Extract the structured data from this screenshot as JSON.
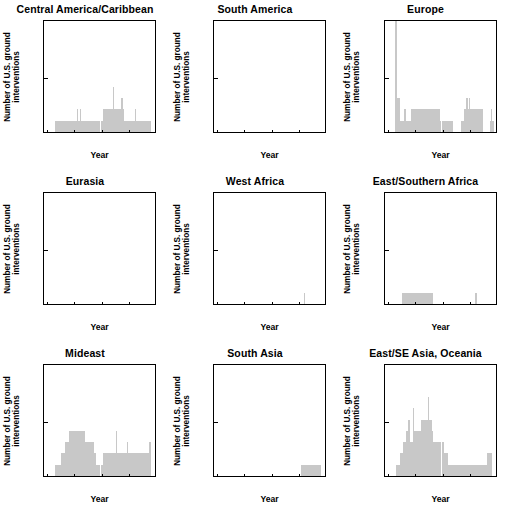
{
  "figure": {
    "axis_label_x": "Year",
    "axis_label_y_line1": "Number of U.S. ground",
    "axis_label_y_line2": "interventions",
    "bar_color": "#c8c8c8",
    "axis_color": "#000000",
    "background": "#ffffff",
    "xticks": [
      "1940",
      "1960",
      "1980",
      "2000",
      "2020"
    ],
    "yticks": [
      "0",
      "5",
      "10"
    ]
  },
  "chart_data": {
    "type": "bar",
    "title": "",
    "xlabel": "Year",
    "ylabel": "Number of U.S. ground interventions",
    "xlim": [
      1938,
      2020
    ],
    "ylim": [
      0,
      10
    ],
    "xtick_values": [
      1940,
      1960,
      1980,
      2000,
      2020
    ],
    "ytick_values": [
      0,
      5,
      10
    ],
    "grid": false,
    "legend": null,
    "bin_width_years": 1,
    "panels": [
      {
        "name": "Central America/Caribbean",
        "row": 1,
        "col": 1,
        "x": [
          1946,
          1947,
          1948,
          1949,
          1950,
          1951,
          1952,
          1953,
          1954,
          1955,
          1956,
          1957,
          1958,
          1959,
          1960,
          1961,
          1962,
          1963,
          1964,
          1965,
          1966,
          1967,
          1968,
          1969,
          1970,
          1971,
          1972,
          1973,
          1974,
          1975,
          1976,
          1977,
          1978,
          1979,
          1980,
          1981,
          1982,
          1983,
          1984,
          1985,
          1986,
          1987,
          1988,
          1989,
          1990,
          1991,
          1992,
          1993,
          1994,
          1995,
          1996,
          1997,
          1998,
          1999,
          2000,
          2001,
          2002,
          2003,
          2004,
          2005,
          2006,
          2007,
          2008,
          2009,
          2010,
          2011,
          2012,
          2013,
          2014,
          2015
        ],
        "y": [
          1,
          1,
          1,
          1,
          1,
          1,
          1,
          1,
          1,
          1,
          1,
          1,
          1,
          1,
          1,
          1,
          2,
          1,
          2,
          1,
          1,
          1,
          1,
          1,
          1,
          1,
          1,
          1,
          1,
          1,
          1,
          1,
          1,
          1,
          1,
          2,
          2,
          2,
          2,
          2,
          2,
          2,
          4,
          2,
          2,
          2,
          2,
          2,
          3,
          2,
          1,
          1,
          1,
          1,
          1,
          1,
          1,
          1,
          2,
          1,
          1,
          1,
          1,
          1,
          1,
          1,
          1,
          1,
          1,
          1
        ]
      },
      {
        "name": "South America",
        "row": 1,
        "col": 2,
        "x": [],
        "y": []
      },
      {
        "name": "Europe",
        "row": 1,
        "col": 3,
        "x": [
          1945,
          1946,
          1947,
          1948,
          1949,
          1950,
          1951,
          1952,
          1953,
          1954,
          1955,
          1956,
          1957,
          1958,
          1959,
          1960,
          1961,
          1962,
          1963,
          1964,
          1965,
          1966,
          1967,
          1968,
          1969,
          1970,
          1971,
          1972,
          1973,
          1974,
          1975,
          1976,
          1977,
          1978,
          1979,
          1980,
          1981,
          1982,
          1983,
          1984,
          1985,
          1986,
          1993,
          1994,
          1995,
          1996,
          1997,
          1998,
          1999,
          2000,
          2001,
          2002,
          2003,
          2004,
          2005,
          2006,
          2007,
          2008,
          2014,
          2015,
          2016
        ],
        "y": [
          10,
          10,
          3,
          3,
          1,
          1,
          1,
          2,
          1,
          1,
          1,
          1,
          2,
          2,
          2,
          2,
          2,
          2,
          2,
          2,
          2,
          2,
          2,
          2,
          2,
          2,
          2,
          2,
          2,
          2,
          2,
          2,
          2,
          1,
          1,
          1,
          1,
          1,
          1,
          1,
          1,
          1,
          1,
          1,
          2,
          2,
          3,
          2,
          3,
          2,
          2,
          2,
          2,
          2,
          2,
          2,
          2,
          2,
          1,
          2,
          1
        ]
      },
      {
        "name": "Eurasia",
        "row": 2,
        "col": 1,
        "x": [],
        "y": []
      },
      {
        "name": "West Africa",
        "row": 2,
        "col": 2,
        "x": [
          2003
        ],
        "y": [
          1
        ]
      },
      {
        "name": "East/Southern Africa",
        "row": 2,
        "col": 3,
        "x": [
          1950,
          1951,
          1952,
          1953,
          1954,
          1955,
          1956,
          1957,
          1958,
          1959,
          1960,
          1961,
          1962,
          1963,
          1964,
          1965,
          1966,
          1967,
          1968,
          1969,
          1970,
          1971,
          1972,
          2003,
          2004
        ],
        "y": [
          1,
          1,
          1,
          1,
          1,
          1,
          1,
          1,
          1,
          1,
          1,
          1,
          1,
          1,
          1,
          1,
          1,
          1,
          1,
          1,
          1,
          1,
          1,
          1,
          1
        ]
      },
      {
        "name": "Mideast",
        "row": 3,
        "col": 1,
        "x": [
          1946,
          1947,
          1948,
          1949,
          1950,
          1951,
          1952,
          1953,
          1954,
          1955,
          1956,
          1957,
          1958,
          1959,
          1960,
          1961,
          1962,
          1963,
          1964,
          1965,
          1966,
          1967,
          1968,
          1969,
          1970,
          1971,
          1972,
          1973,
          1974,
          1975,
          1976,
          1977,
          1978,
          1979,
          1980,
          1981,
          1982,
          1983,
          1984,
          1985,
          1986,
          1987,
          1988,
          1989,
          1990,
          1991,
          1992,
          1993,
          1994,
          1995,
          1996,
          1997,
          1998,
          1999,
          2000,
          2001,
          2002,
          2003,
          2004,
          2005,
          2006,
          2007,
          2008,
          2009,
          2010,
          2011,
          2012,
          2013,
          2014,
          2015
        ],
        "y": [
          1,
          1,
          1,
          1,
          2,
          2,
          2,
          3,
          3,
          3,
          4,
          4,
          4,
          4,
          4,
          4,
          4,
          4,
          4,
          4,
          4,
          4,
          3,
          3,
          3,
          3,
          3,
          3,
          2,
          2,
          1,
          1,
          1,
          1,
          1,
          2,
          2,
          2,
          2,
          2,
          2,
          2,
          2,
          2,
          4,
          2,
          2,
          2,
          2,
          2,
          2,
          2,
          3,
          2,
          2,
          2,
          2,
          2,
          2,
          2,
          2,
          2,
          2,
          2,
          2,
          2,
          2,
          2,
          3,
          3
        ]
      },
      {
        "name": "South Asia",
        "row": 3,
        "col": 2,
        "x": [
          2001,
          2002,
          2003,
          2004,
          2005,
          2006,
          2007,
          2008,
          2009,
          2010,
          2011,
          2012,
          2013,
          2014,
          2015
        ],
        "y": [
          1,
          1,
          1,
          1,
          1,
          1,
          1,
          1,
          1,
          1,
          1,
          1,
          1,
          1,
          1
        ]
      },
      {
        "name": "East/SE Asia, Oceania",
        "row": 3,
        "col": 3,
        "x": [
          1946,
          1947,
          1948,
          1949,
          1950,
          1951,
          1952,
          1953,
          1954,
          1955,
          1956,
          1957,
          1958,
          1959,
          1960,
          1961,
          1962,
          1963,
          1964,
          1965,
          1966,
          1967,
          1968,
          1969,
          1970,
          1971,
          1972,
          1973,
          1974,
          1975,
          1976,
          1977,
          1978,
          1979,
          1980,
          1981,
          1982,
          1983,
          1984,
          1985,
          1986,
          1987,
          1988,
          1989,
          1990,
          1991,
          1992,
          1993,
          1994,
          1995,
          1996,
          1997,
          1998,
          1999,
          2000,
          2001,
          2002,
          2003,
          2004,
          2005,
          2006,
          2007,
          2008,
          2009,
          2010,
          2011,
          2012,
          2013,
          2014,
          2015
        ],
        "y": [
          1,
          1,
          1,
          2,
          2,
          3,
          3,
          4,
          4,
          5,
          3,
          3,
          6,
          4,
          4,
          4,
          4,
          4,
          5,
          5,
          5,
          5,
          5,
          7,
          5,
          5,
          4,
          3,
          3,
          3,
          3,
          3,
          3,
          3,
          3,
          2,
          2,
          2,
          1,
          1,
          1,
          1,
          1,
          1,
          1,
          1,
          1,
          1,
          1,
          1,
          1,
          1,
          1,
          1,
          1,
          1,
          1,
          1,
          1,
          1,
          1,
          1,
          1,
          1,
          1,
          1,
          2,
          2,
          2,
          2
        ]
      }
    ]
  }
}
